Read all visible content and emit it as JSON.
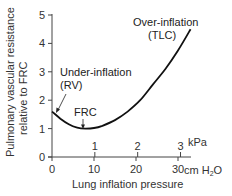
{
  "chart_data": {
    "type": "line",
    "title": "",
    "xlabel": "Lung inflation pressure",
    "ylabel": "Pulmonary vascular resistance relative to FRC",
    "ylabel_lines": [
      "Pulmonary vascular resistance",
      "relative to FRC"
    ],
    "x_unit_primary": "cm H2O",
    "x_unit_secondary": "kPa",
    "xlim": [
      0,
      33
    ],
    "ylim": [
      0,
      5
    ],
    "x_ticks_cmh2o": [
      "0",
      "10",
      "20",
      "30"
    ],
    "x_ticks_kpa": [
      "1",
      "2",
      "3"
    ],
    "y_ticks": [
      "0",
      "1",
      "2",
      "3",
      "4",
      "5"
    ],
    "grid": false,
    "legend": null,
    "series": [
      {
        "name": "Pulmonary vascular resistance",
        "x": [
          0,
          2,
          4,
          6,
          8,
          10,
          12,
          15,
          18,
          21,
          24,
          27,
          30,
          33
        ],
        "y": [
          1.6,
          1.35,
          1.15,
          1.03,
          1.0,
          1.02,
          1.1,
          1.3,
          1.6,
          2.0,
          2.55,
          3.1,
          3.75,
          4.5
        ]
      }
    ],
    "annotations": [
      {
        "text_lines": [
          "Under-inflation",
          "(RV)"
        ],
        "points_to": {
          "x": 0.5,
          "y": 1.55
        }
      },
      {
        "text": "FRC",
        "points_to": {
          "x": 8,
          "y": 1.0
        }
      },
      {
        "text_lines": [
          "Over-inflation",
          "(TLC)"
        ],
        "points_to": {
          "x": 33,
          "y": 4.5
        }
      }
    ]
  },
  "labels": {
    "xlabel": "Lung inflation pressure",
    "ylabel_line1": "Pulmonary vascular resistance",
    "ylabel_line2": "relative to FRC",
    "unit_cmh2o_prefix": "cm H",
    "unit_cmh2o_sub": "2",
    "unit_cmh2o_suffix": "O",
    "unit_kpa": "kPa",
    "under_line1": "Under-inflation",
    "under_line2": "(RV)",
    "frc": "FRC",
    "over_line1": "Over-inflation",
    "over_line2": "(TLC)"
  }
}
